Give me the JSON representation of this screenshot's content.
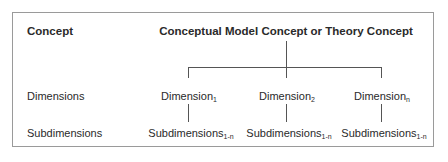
{
  "diagram": {
    "header": {
      "left": "Concept",
      "root": "Conceptual Model Concept or Theory Concept"
    },
    "rows": {
      "dimensions_label": "Dimensions",
      "subdimensions_label": "Subdimensions"
    },
    "dimensions": [
      {
        "base": "Dimension",
        "sub": "1"
      },
      {
        "base": "Dimension",
        "sub": "2"
      },
      {
        "base": "Dimension",
        "sub": "n"
      }
    ],
    "subdimensions": [
      {
        "base": "Subdimensions",
        "sub": "1-n"
      },
      {
        "base": "Subdimensions",
        "sub": "1-n"
      },
      {
        "base": "Subdimensions",
        "sub": "1-n"
      }
    ]
  }
}
